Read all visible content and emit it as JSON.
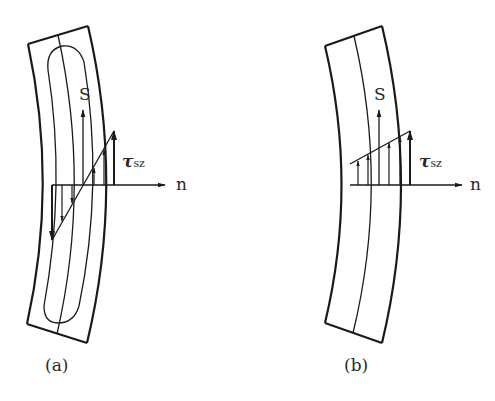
{
  "figure_a": {
    "caption": "(a)",
    "s_label": "S",
    "n_label": "n",
    "tau_symbol": "τ",
    "tau_subscript": "sz",
    "description": "Curved thin-walled section with closed loop; shear stress tau_sz varies linearly across thickness, zero at centerline"
  },
  "figure_b": {
    "caption": "(b)",
    "s_label": "S",
    "n_label": "n",
    "tau_symbol": "τ",
    "tau_subscript": "sz",
    "description": "Curved thin-walled section; shear stress tau_sz trapezoidal distribution, all positive across thickness"
  },
  "colors": {
    "stroke": "#1a1a1a",
    "text": "#2a2a2a",
    "background": "#ffffff"
  }
}
